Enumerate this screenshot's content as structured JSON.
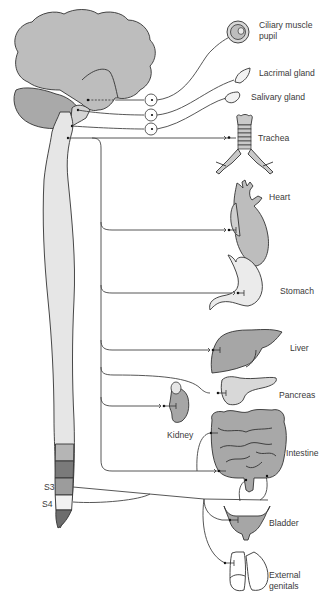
{
  "diagram": {
    "colors": {
      "brain_fill": "#bdbdbd",
      "cerebellum_fill": "#a9a9a9",
      "spinal_cord_fill": "#e6e6e6",
      "organ_dark": "#a6a6a6",
      "organ_mid": "#bfbfbf",
      "organ_light": "#ebebeb",
      "line": "#444444",
      "label": "#3a3a3a"
    },
    "labels": {
      "ciliary_line1": "Ciliary muscle",
      "ciliary_line2": "pupil",
      "lacrimal": "Lacrimal gland",
      "salivary": "Salivary gland",
      "trachea": "Trachea",
      "heart": "Heart",
      "stomach": "Stomach",
      "liver": "Liver",
      "pancreas": "Pancreas",
      "kidney": "Kidney",
      "intestine": "Intestine",
      "bladder": "Bladder",
      "genitals_line1": "External",
      "genitals_line2": "genitals",
      "s3": "S3",
      "s4": "S4"
    },
    "organs": [
      "Ciliary muscle pupil",
      "Lacrimal gland",
      "Salivary gland",
      "Trachea",
      "Heart",
      "Stomach",
      "Liver",
      "Pancreas",
      "Kidney",
      "Intestine",
      "Bladder",
      "External genitals"
    ],
    "ganglia_count": 3,
    "sacral_segments": [
      "S3",
      "S4"
    ]
  }
}
